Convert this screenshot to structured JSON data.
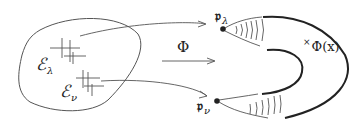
{
  "diagram": {
    "type": "map-diagram",
    "colors": {
      "thin_line": "#555555",
      "thick_line": "#222222",
      "text": "#222222",
      "background": "#ffffff"
    },
    "domain_set": {
      "labels": [
        {
          "base": "ℰ",
          "sub": "λ"
        },
        {
          "base": "ℰ",
          "sub": "ν"
        }
      ]
    },
    "map": {
      "label": "Φ"
    },
    "image": {
      "points": [
        {
          "base": "𝔭",
          "sub": "λ"
        },
        {
          "base": "𝔭",
          "sub": "ν"
        }
      ],
      "point_label": {
        "cross": "×",
        "text": "Φ(x)"
      }
    }
  }
}
